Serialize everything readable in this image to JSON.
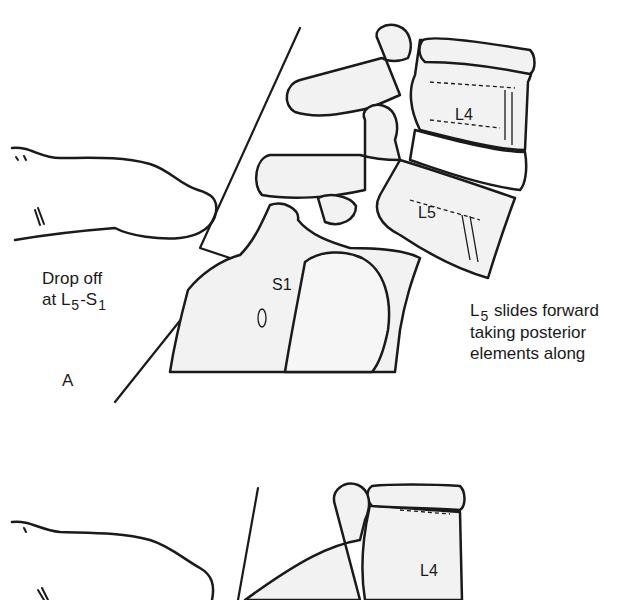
{
  "figure": {
    "panel_a": {
      "panel_label": "A",
      "annotation_left": {
        "line1": "Drop off",
        "line2_prefix": "at L",
        "line2_sub1": "5",
        "line2_mid": "-S",
        "line2_sub2": "1"
      },
      "annotation_right": {
        "line1_prefix": "L",
        "line1_sub": "5",
        "line1_rest": " slides forward",
        "line2": "taking posterior",
        "line3": "elements along"
      },
      "vertebra_labels": {
        "l4": "L4",
        "l5": "L5",
        "s1": "S1"
      }
    },
    "panel_b": {
      "vertebra_labels": {
        "l4": "L4"
      }
    },
    "colors": {
      "ink": "#1a1a1a",
      "bone_fill": "#f2f2f2",
      "background": "#ffffff"
    }
  }
}
